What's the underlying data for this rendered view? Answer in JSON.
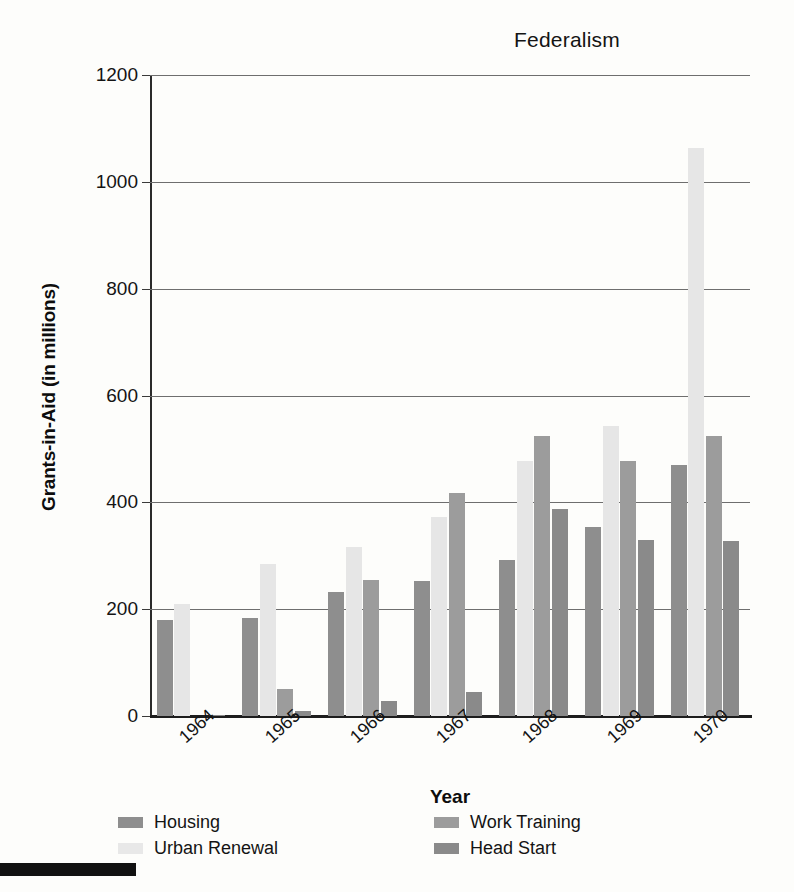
{
  "chart_data": {
    "type": "bar",
    "title": "Federalism",
    "xlabel": "Year",
    "ylabel": "Grants-in-Aid (in millions)",
    "categories": [
      "1964",
      "1965",
      "1966",
      "1967",
      "1968",
      "1969",
      "1970"
    ],
    "ylim": [
      0,
      1200
    ],
    "yticks": [
      0,
      200,
      400,
      600,
      800,
      1000,
      1200
    ],
    "ytick_labels": [
      "0",
      "200",
      "400",
      "600",
      "800",
      "1000",
      "1200"
    ],
    "grid": true,
    "legend_position": "bottom",
    "series": [
      {
        "name": "Housing",
        "color": "#8e8e8e",
        "values": [
          180,
          183,
          232,
          253,
          293,
          353,
          470
        ]
      },
      {
        "name": "Urban Renewal",
        "color": "#e6e6e6",
        "values": [
          210,
          285,
          316,
          373,
          478,
          543,
          1063
        ]
      },
      {
        "name": "Work Training",
        "color": "#9c9c9c",
        "values": [
          0,
          50,
          255,
          417,
          525,
          478,
          525
        ]
      },
      {
        "name": "Head Start",
        "color": "#8a8a8a",
        "values": [
          2,
          10,
          28,
          45,
          388,
          330,
          328
        ]
      }
    ]
  },
  "legend": {
    "items": [
      {
        "label": "Housing"
      },
      {
        "label": "Urban Renewal"
      },
      {
        "label": "Work Training"
      },
      {
        "label": "Head Start"
      }
    ]
  }
}
